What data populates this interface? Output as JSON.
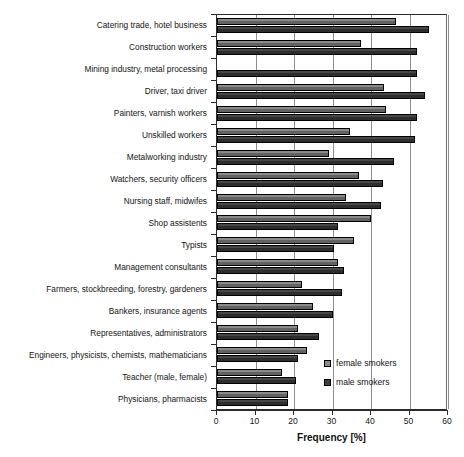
{
  "chart": {
    "type": "bar",
    "title": "",
    "xlabel": "Frequency [%]",
    "ylabel": ""
  },
  "legend": {
    "position": "inside-bottom-right",
    "entries": [
      {
        "label": "female smokers",
        "color": "#8a8a8a",
        "key": "female"
      },
      {
        "label": "male smokers",
        "color": "#3d3d3d",
        "key": "male"
      }
    ]
  },
  "axis": {
    "x_min": 0,
    "x_max": 60,
    "x_tick_labels": [
      "0",
      "10",
      "20",
      "30",
      "40",
      "50",
      "60"
    ],
    "x_ticks": [
      0,
      10,
      20,
      30,
      40,
      50,
      60
    ],
    "grid": true
  },
  "chart_data": {
    "type": "bar",
    "orientation": "horizontal",
    "title": "",
    "xlabel": "Frequency [%]",
    "ylabel": "",
    "xlim": [
      0,
      60
    ],
    "grid": true,
    "legend_position": "inside-bottom-right",
    "categories": [
      "Catering trade, hotel business",
      "Construction workers",
      "Mining industry, metal processing",
      "Driver, taxi driver",
      "Painters, varnish workers",
      "Unskilled workers",
      "Metalworking industry",
      "Watchers, security officers",
      "Nursing staff, midwifes",
      "Shop assistents",
      "Typists",
      "Management consultants",
      "Farmers, stockbreeding, forestry, gardeners",
      "Bankers, insurance agents",
      "Representatives, administrators",
      "Engineers, physicists, chemists, mathematicians",
      "Teacher (male, female)",
      "Physicians, pharmacists"
    ],
    "series": [
      {
        "name": "female smokers",
        "color": "#8a8a8a",
        "values": [
          46.5,
          37.5,
          0,
          43.5,
          44.0,
          34.5,
          29.0,
          37.0,
          33.5,
          40.0,
          35.5,
          31.5,
          22.0,
          25.0,
          21.0,
          23.5,
          17.0,
          18.5
        ]
      },
      {
        "name": "male smokers",
        "color": "#3d3d3d",
        "values": [
          55.0,
          52.0,
          52.0,
          54.0,
          52.0,
          51.5,
          46.0,
          43.0,
          42.5,
          31.5,
          30.5,
          33.0,
          32.5,
          30.0,
          26.5,
          21.0,
          20.5,
          18.5
        ]
      }
    ]
  }
}
